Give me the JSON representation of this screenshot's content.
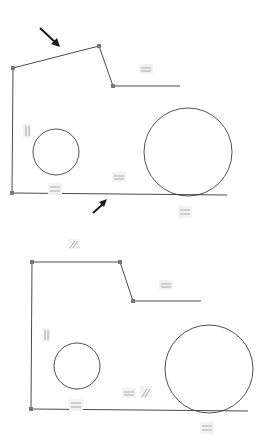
{
  "diagram": {
    "panels": [
      {
        "name": "before",
        "pointer_arrows": 2,
        "constraints": [
          "horizontal",
          "vertical",
          "horizontal",
          "horizontal",
          "horizontal"
        ]
      },
      {
        "name": "after",
        "constraints": [
          "parallel",
          "horizontal",
          "vertical",
          "horizontal",
          "horizontal",
          "parallel",
          "horizontal"
        ]
      }
    ],
    "icons": {
      "horizontal": "equal-bars-icon",
      "vertical": "vertical-bars-icon",
      "parallel": "parallel-slash-icon",
      "pointer": "arrow-icon"
    },
    "colors": {
      "line": "#4a4a4a",
      "point": "#777777",
      "arrow": "#1a1a1a",
      "constraint_icon": "#9a9a9a"
    }
  }
}
